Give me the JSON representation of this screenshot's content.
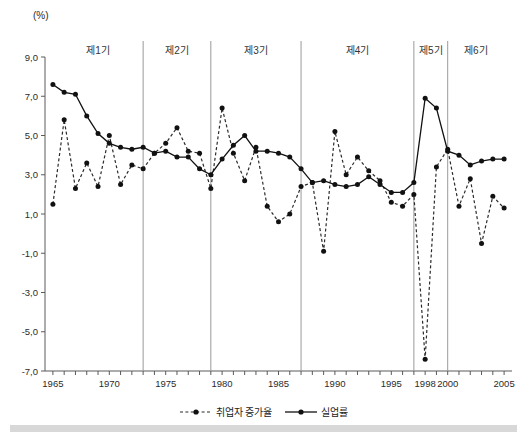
{
  "axis": {
    "unit_label": "(%)",
    "y_ticks": [
      "9,0",
      "7,0",
      "5,0",
      "3,0",
      "1,0",
      "-1,0",
      "-3,0",
      "-5,0",
      "-7,0"
    ],
    "y_tick_values": [
      9.0,
      7.0,
      5.0,
      3.0,
      1.0,
      -1.0,
      -3.0,
      -5.0,
      -7.0
    ],
    "x_ticks": [
      "1965",
      "1970",
      "1975",
      "1980",
      "1985",
      "1990",
      "1995",
      "1998",
      "2000",
      "2005"
    ],
    "x_tick_values": [
      1965,
      1970,
      1975,
      1980,
      1985,
      1990,
      1995,
      1998,
      2000,
      2005
    ]
  },
  "periods": [
    {
      "label": "제1기",
      "start": 1965,
      "end": 1973
    },
    {
      "label": "제2기",
      "start": 1973,
      "end": 1979
    },
    {
      "label": "제3기",
      "start": 1979,
      "end": 1987
    },
    {
      "label": "제4기",
      "start": 1987,
      "end": 1997
    },
    {
      "label": "제5기",
      "start": 1997,
      "end": 2000
    },
    {
      "label": "제6기",
      "start": 2000,
      "end": 2005
    }
  ],
  "separators": [
    1973,
    1979,
    1987,
    1997,
    2000
  ],
  "legend": [
    {
      "label": "취업자 증가율",
      "style": "dashed"
    },
    {
      "label": "실업률",
      "style": "solid"
    }
  ],
  "chart_data": {
    "type": "line",
    "title": "",
    "xlabel": "",
    "ylabel": "(%)",
    "xlim": [
      1964.3,
      2005.7
    ],
    "ylim": [
      -7.0,
      9.0
    ],
    "grid": false,
    "legend_position": "bottom",
    "x": [
      1965,
      1966,
      1967,
      1968,
      1969,
      1970,
      1971,
      1972,
      1973,
      1974,
      1975,
      1976,
      1977,
      1978,
      1979,
      1980,
      1981,
      1982,
      1983,
      1984,
      1985,
      1986,
      1987,
      1988,
      1989,
      1990,
      1991,
      1992,
      1993,
      1994,
      1995,
      1996,
      1997,
      1998,
      1999,
      2000,
      2001,
      2002,
      2003,
      2004,
      2005
    ],
    "series": [
      {
        "name": "실업률",
        "style": "solid",
        "values": [
          7.6,
          7.2,
          7.1,
          6.0,
          5.1,
          4.6,
          4.4,
          4.3,
          4.4,
          4.1,
          4.2,
          3.9,
          3.9,
          3.3,
          3.0,
          3.8,
          4.5,
          5.0,
          4.2,
          4.2,
          4.1,
          3.9,
          3.3,
          2.6,
          2.7,
          2.5,
          2.4,
          2.5,
          2.9,
          2.5,
          2.1,
          2.1,
          2.6,
          6.9,
          6.4,
          4.2,
          4.0,
          3.5,
          3.7,
          3.8,
          3.8
        ]
      },
      {
        "name": "취업자 증가율",
        "style": "dashed",
        "values": [
          1.5,
          5.8,
          2.3,
          3.6,
          2.4,
          5.0,
          2.5,
          3.5,
          3.3,
          4.1,
          4.6,
          5.4,
          4.2,
          4.1,
          2.3,
          6.4,
          4.1,
          2.7,
          4.4,
          1.4,
          0.6,
          1.0,
          2.4,
          2.6,
          -0.9,
          5.2,
          3.0,
          3.9,
          3.2,
          2.7,
          1.6,
          1.4,
          2.0,
          -6.4,
          3.4,
          4.3,
          1.4,
          2.8,
          -0.5,
          1.9,
          1.3
        ]
      }
    ]
  }
}
